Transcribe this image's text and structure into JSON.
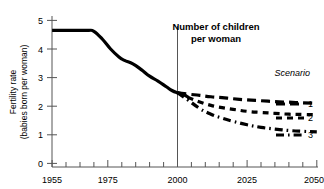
{
  "chart_data": {
    "type": "line",
    "title": "Number of children per woman",
    "title_line1": "Number of children",
    "title_line2": "per woman",
    "xlabel": "",
    "ylabel": "Fertility rate (babies born per woman)",
    "ylabel_line1": "Fertility rate",
    "ylabel_line2": "(babies born per woman)",
    "xlim": [
      1955,
      2050
    ],
    "ylim": [
      0,
      5
    ],
    "grid": false,
    "legend_position": "right",
    "legend_title": "Scenario",
    "x_tick_labels": [
      "1955",
      "1975",
      "2000",
      "2025",
      "2050"
    ],
    "x_tick_values": [
      1955,
      1975,
      2000,
      2025,
      2050
    ],
    "x_minor_tick_values": [
      1960,
      1965,
      1970,
      1980,
      1985,
      1990,
      1995,
      2005,
      2010,
      2015,
      2020,
      2030,
      2035,
      2040,
      2045
    ],
    "y_tick_labels": [
      "0",
      "1",
      "2",
      "3",
      "4",
      "5"
    ],
    "y_tick_values": [
      0,
      1,
      2,
      3,
      4,
      5
    ],
    "annotations": [
      {
        "name": "projection-divider",
        "x": 2000,
        "label": ""
      }
    ],
    "series": [
      {
        "name": "Historical",
        "style": "solid",
        "label": "",
        "x": [
          1955,
          1960,
          1965,
          1968,
          1970,
          1973,
          1976,
          1979,
          1981,
          1984,
          1987,
          1990,
          1993,
          1996,
          1998,
          2000,
          2002,
          2004
        ],
        "values": [
          4.65,
          4.65,
          4.65,
          4.65,
          4.62,
          4.35,
          4.0,
          3.72,
          3.6,
          3.48,
          3.28,
          3.05,
          2.88,
          2.68,
          2.55,
          2.47,
          2.42,
          2.3
        ]
      },
      {
        "name": "Scenario 1",
        "style": "long-dash",
        "label": "1",
        "x": [
          2000,
          2004,
          2008,
          2012,
          2016,
          2020,
          2025,
          2030,
          2035,
          2040,
          2045,
          2050
        ],
        "values": [
          2.47,
          2.42,
          2.38,
          2.33,
          2.3,
          2.26,
          2.22,
          2.19,
          2.16,
          2.14,
          2.12,
          2.1
        ]
      },
      {
        "name": "Scenario 2",
        "style": "dash",
        "label": "2",
        "x": [
          2000,
          2004,
          2008,
          2012,
          2016,
          2020,
          2025,
          2030,
          2035,
          2040,
          2045,
          2050
        ],
        "values": [
          2.47,
          2.3,
          2.15,
          2.03,
          1.95,
          1.89,
          1.82,
          1.78,
          1.75,
          1.72,
          1.71,
          1.7
        ]
      },
      {
        "name": "Scenario 3",
        "style": "dash-dot",
        "label": "3",
        "x": [
          2000,
          2004,
          2008,
          2012,
          2016,
          2020,
          2025,
          2030,
          2035,
          2040,
          2045,
          2050
        ],
        "values": [
          2.47,
          2.2,
          1.92,
          1.72,
          1.58,
          1.47,
          1.35,
          1.26,
          1.2,
          1.15,
          1.12,
          1.1
        ]
      }
    ]
  },
  "legend": {
    "title": "Scenario",
    "entries": [
      {
        "label": "1",
        "style": "long-dash"
      },
      {
        "label": "2",
        "style": "dash"
      },
      {
        "label": "3",
        "style": "dash-dot"
      }
    ]
  }
}
